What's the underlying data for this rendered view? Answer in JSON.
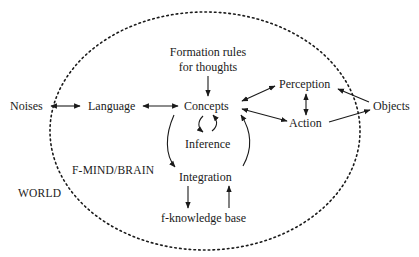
{
  "diagram": {
    "type": "concept-flow",
    "regions": {
      "outer": "WORLD",
      "inner": "F-MIND/BRAIN"
    },
    "nodes": {
      "noises": "Noises",
      "language": "Language",
      "formation_rules_line1": "Formation rules",
      "formation_rules_line2": "for thoughts",
      "concepts": "Concepts",
      "inference": "Inference",
      "integration": "Integration",
      "knowledge_base": "f-knowledge base",
      "perception": "Perception",
      "action": "Action",
      "objects": "Objects"
    },
    "edges": [
      {
        "from": "Noises",
        "to": "Language",
        "direction": "both"
      },
      {
        "from": "Language",
        "to": "Concepts",
        "direction": "both"
      },
      {
        "from": "Formation rules for thoughts",
        "to": "Concepts",
        "direction": "forward"
      },
      {
        "from": "Concepts",
        "to": "Perception",
        "direction": "both"
      },
      {
        "from": "Concepts",
        "to": "Action",
        "direction": "both"
      },
      {
        "from": "Perception",
        "to": "Action",
        "direction": "both"
      },
      {
        "from": "Objects",
        "to": "Perception",
        "direction": "forward"
      },
      {
        "from": "Action",
        "to": "Objects",
        "direction": "forward"
      },
      {
        "from": "Concepts",
        "to": "Inference",
        "direction": "cycle"
      },
      {
        "from": "Concepts",
        "to": "Integration",
        "direction": "forward"
      },
      {
        "from": "Integration",
        "to": "Concepts",
        "direction": "forward"
      },
      {
        "from": "Integration",
        "to": "f-knowledge base",
        "direction": "forward"
      },
      {
        "from": "f-knowledge base",
        "to": "Integration",
        "direction": "forward"
      }
    ],
    "colors": {
      "ink": "#1a1a1a",
      "background": "#ffffff"
    }
  }
}
